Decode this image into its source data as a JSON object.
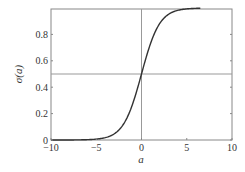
{
  "chart_data": {
    "type": "line",
    "title": "",
    "xlabel": "a",
    "ylabel": "σ(a)",
    "xlim": [
      -10,
      10
    ],
    "ylim": [
      0,
      1
    ],
    "xticks": [
      -10,
      -5,
      0,
      5,
      10
    ],
    "xtick_labels": [
      "−10",
      "−5",
      "0",
      "5",
      "10"
    ],
    "yticks": [
      0,
      0.2,
      0.4,
      0.6,
      0.8
    ],
    "ytick_labels": [
      "0",
      "0.2",
      "0.4",
      "0.6",
      "0.8"
    ],
    "grid": false,
    "legend": null,
    "reference_lines": [
      {
        "orientation": "horizontal",
        "value": 0.5
      },
      {
        "orientation": "vertical",
        "value": 0
      }
    ],
    "series": [
      {
        "name": "logistic sigmoid",
        "function": "1/(1+exp(-a))",
        "x": [
          -10,
          -8,
          -6,
          -5,
          -4,
          -3,
          -2,
          -1,
          0,
          1,
          2,
          3,
          4,
          5,
          6,
          6.5
        ],
        "values": [
          0.0,
          0.0003,
          0.0025,
          0.0067,
          0.018,
          0.0474,
          0.1192,
          0.2689,
          0.5,
          0.7311,
          0.8808,
          0.9526,
          0.982,
          0.9933,
          0.9975,
          0.9985
        ]
      }
    ],
    "colors": {
      "curve": "#333333",
      "axes": "#888888",
      "reference": "#999999"
    }
  }
}
